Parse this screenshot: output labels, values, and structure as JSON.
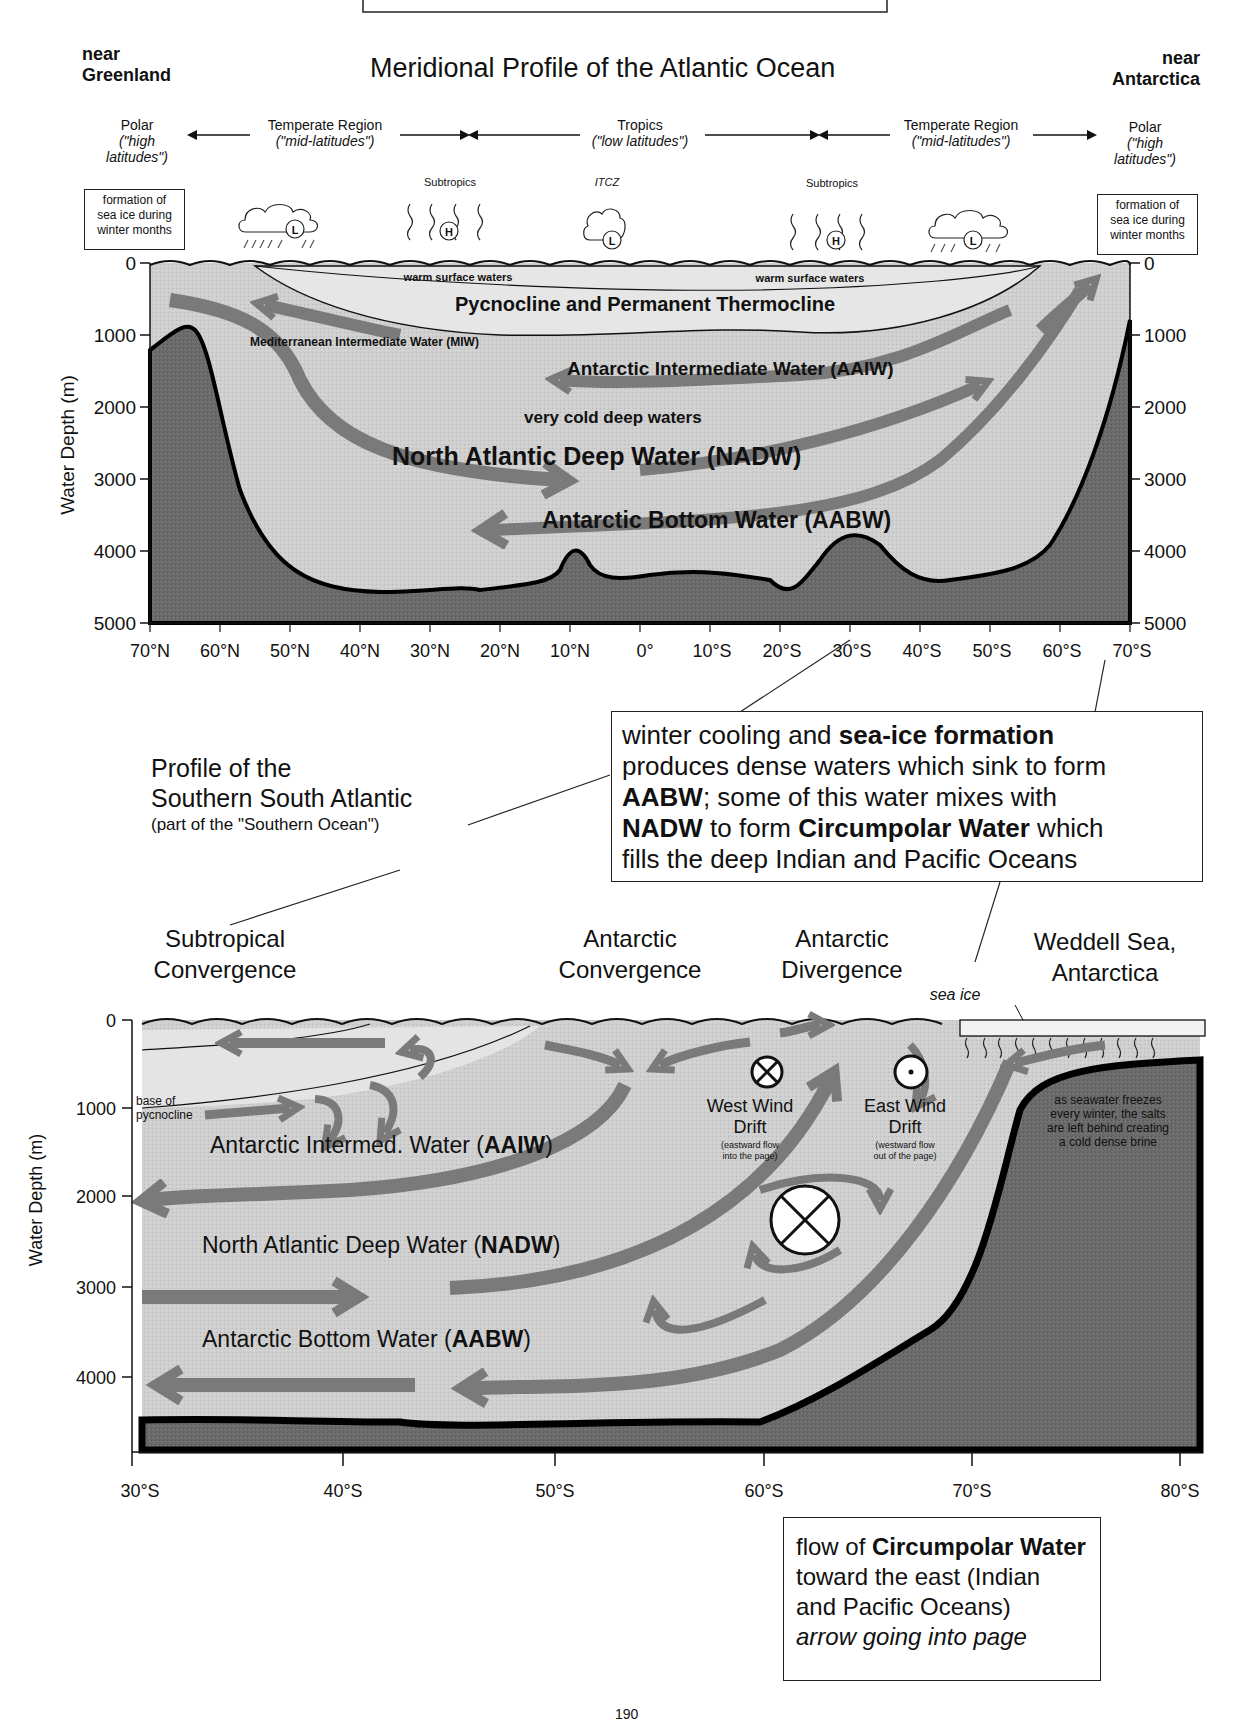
{
  "top_box": {
    "present": true
  },
  "top": {
    "title": "Meridional Profile of the Atlantic Ocean",
    "left_corner": {
      "line1": "near",
      "line2": "Greenland"
    },
    "right_corner": {
      "line1": "near",
      "line2": "Antarctica"
    },
    "regions": [
      {
        "label": "Polar",
        "sub1": "(\"high",
        "sub2": "latitudes\")"
      },
      {
        "label": "Temperate Region",
        "sub1": "(\"mid-latitudes\")"
      },
      {
        "label": "Tropics",
        "sub1": "(\"low latitudes\")"
      },
      {
        "label": "Temperate Region",
        "sub1": "(\"mid-latitudes\")"
      },
      {
        "label": "Polar",
        "sub1": "(\"high",
        "sub2": "latitudes\")"
      }
    ],
    "weather_labels": {
      "subtropics_left": "Subtropics",
      "itcz": "ITCZ",
      "subtropics_right": "Subtropics"
    },
    "pressure_symbols": [
      "L",
      "H",
      "L",
      "H",
      "L"
    ],
    "sea_ice_box": {
      "line1": "formation of",
      "line2": "sea ice during",
      "line3": "winter months"
    },
    "labels": {
      "warm_surface_left": "warm surface waters",
      "warm_surface_right": "warm surface waters",
      "pycnocline": "Pycnocline and Permanent Thermocline",
      "miw": "Mediterranean Intermediate Water (MIW)",
      "aaiw": "Antarctic Intermediate Water (AAIW)",
      "very_cold": "very cold deep waters",
      "nadw": "North Atlantic Deep Water (NADW)",
      "aabw": "Antarctic Bottom Water (AABW)"
    },
    "y_axis_label": "Water Depth (m)",
    "y_ticks": [
      "0",
      "1000",
      "2000",
      "3000",
      "4000",
      "5000"
    ],
    "x_ticks": [
      "70°N",
      "60°N",
      "50°N",
      "40°N",
      "30°N",
      "20°N",
      "10°N",
      "0°",
      "10°S",
      "20°S",
      "30°S",
      "40°S",
      "50°S",
      "60°S",
      "70°S"
    ]
  },
  "middle": {
    "profile_title": {
      "line1": "Profile of the",
      "line2": "Southern South Atlantic",
      "line3": "(part of the \"Southern Ocean\")"
    },
    "callout": {
      "p1_normal": "winter cooling and ",
      "p1_bold": "sea-ice formation",
      "p2": "produces dense waters which sink to form",
      "p3_bold": "AABW",
      "p3_normal": ";  some of this water mixes with",
      "p4_bold1": "NADW",
      "p4_normal1": " to form ",
      "p4_bold2": "Circumpolar Water",
      "p4_normal2": " which",
      "p5": "fills the deep Indian and Pacific Oceans"
    }
  },
  "bottom": {
    "headers": {
      "subtropical": {
        "line1": "Subtropical",
        "line2": "Convergence"
      },
      "ant_conv": {
        "line1": "Antarctic",
        "line2": "Convergence"
      },
      "ant_div": {
        "line1": "Antarctic",
        "line2": "Divergence"
      },
      "weddell": {
        "line1": "Weddell Sea,",
        "line2": "Antarctica"
      }
    },
    "sea_ice": "sea ice",
    "base_pycnocline": {
      "line1": "base of",
      "line2": "pycnocline"
    },
    "west_wind": {
      "line1": "West Wind",
      "line2": "Drift",
      "sub1": "(eastward flow",
      "sub2": "into the page)"
    },
    "east_wind": {
      "line1": "East Wind",
      "line2": "Drift",
      "sub1": "(westward flow",
      "sub2": "out of the page)"
    },
    "brine": {
      "line1": "as seawater freezes",
      "line2": "every winter, the salts",
      "line3": "are left behind creating",
      "line4": "a cold dense brine"
    },
    "aaiw": {
      "normal": "Antarctic Intermed. Water (",
      "bold": "AAIW",
      "end": ")"
    },
    "nadw": {
      "normal": "North Atlantic Deep Water (",
      "bold": "NADW",
      "end": ")"
    },
    "aabw": {
      "normal": "Antarctic Bottom Water (",
      "bold": "AABW",
      "end": ")"
    },
    "y_axis_label": "Water Depth (m)",
    "y_ticks": [
      "0",
      "1000",
      "2000",
      "3000",
      "4000"
    ],
    "x_ticks": [
      "30°S",
      "40°S",
      "50°S",
      "60°S",
      "70°S",
      "80°S"
    ],
    "legend_box": {
      "l1_normal": "flow of ",
      "l1_bold": "Circumpolar Water",
      "l2": "toward the east (Indian",
      "l3": "and Pacific Oceans)",
      "l4_italic": "arrow going into page"
    }
  },
  "page_number": "190",
  "colors": {
    "water_light": "#d4d4d4",
    "water_mid": "#c2c2c2",
    "seafloor": "#6e6e6e",
    "arrow": "#7a7a7a",
    "line": "#111111"
  }
}
